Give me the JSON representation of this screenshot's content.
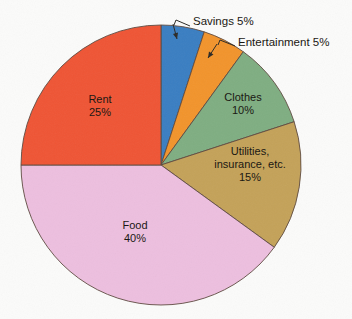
{
  "page": {
    "background_color": "#fbfbfa",
    "bleed_text": "APPENDIX"
  },
  "chart_data": {
    "type": "pie",
    "title": "",
    "subtitle": "",
    "xlabel": "",
    "ylabel": "",
    "legend_position": "none",
    "grid": false,
    "units": "percent",
    "total": 100,
    "start_angle_deg": 0,
    "direction": "clockwise",
    "center": {
      "x": 161,
      "y": 165
    },
    "radius": 140,
    "categories": [
      "Savings",
      "Entertainment",
      "Clothes",
      "Utilities, insurance, etc.",
      "Food",
      "Rent"
    ],
    "values": [
      5,
      5,
      10,
      15,
      40,
      25
    ],
    "colors": [
      "#3a7ec2",
      "#f2942c",
      "#7fae82",
      "#c4a259",
      "#edbfdf",
      "#ef5535"
    ],
    "slices": [
      {
        "name": "Savings",
        "value": 5,
        "value_label": "5%",
        "color": "#3a7ec2",
        "start_deg": 0,
        "end_deg": 18,
        "label_style": "callout",
        "label_lines": [
          "Savings 5%"
        ],
        "callout_text": "Savings 5%",
        "callout_text_x": 193,
        "callout_text_y": 22,
        "leader_path": "M 190 26 L 176 20 L 174 25",
        "arrow_tip": {
          "x": 177,
          "y": 39
        },
        "arrow_from": {
          "x": 173,
          "y": 24
        }
      },
      {
        "name": "Entertainment",
        "value": 5,
        "value_label": "5%",
        "color": "#f2942c",
        "start_deg": 18,
        "end_deg": 36,
        "label_style": "callout",
        "label_lines": [
          "Entertainment 5%"
        ],
        "callout_text": "Entertainment 5%",
        "callout_text_x": 238,
        "callout_text_y": 43,
        "leader_path": "M 235 46 L 220 40 L 218 45",
        "arrow_tip": {
          "x": 208,
          "y": 58
        },
        "arrow_from": {
          "x": 217,
          "y": 44
        }
      },
      {
        "name": "Clothes",
        "value": 10,
        "value_label": "10%",
        "color": "#7fae82",
        "start_deg": 36,
        "end_deg": 72,
        "label_style": "inside",
        "label_lines": [
          "Clothes",
          "10%"
        ],
        "label_x": 243,
        "label_y": 104
      },
      {
        "name": "Utilities, insurance, etc.",
        "value": 15,
        "value_label": "15%",
        "color": "#c4a259",
        "start_deg": 72,
        "end_deg": 126,
        "label_style": "inside",
        "label_lines": [
          "Utilities,",
          "insurance, etc.",
          "15%"
        ],
        "label_x": 250,
        "label_y": 165
      },
      {
        "name": "Food",
        "value": 40,
        "value_label": "40%",
        "color": "#edbfdf",
        "start_deg": 126,
        "end_deg": 270,
        "label_style": "inside",
        "label_lines": [
          "Food",
          "40%"
        ],
        "label_x": 135,
        "label_y": 232
      },
      {
        "name": "Rent",
        "value": 25,
        "value_label": "25%",
        "color": "#ef5535",
        "start_deg": 270,
        "end_deg": 360,
        "label_style": "inside",
        "label_lines": [
          "Rent",
          "25%"
        ],
        "label_x": 100,
        "label_y": 106
      }
    ]
  }
}
